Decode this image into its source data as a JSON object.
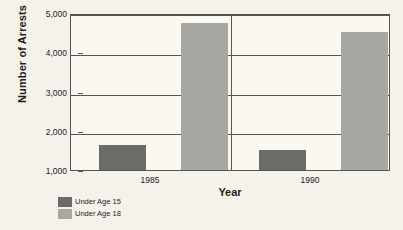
{
  "chart_data": {
    "type": "bar",
    "title": "",
    "xlabel": "Year",
    "ylabel": "Number of Arrests",
    "categories": [
      "1985",
      "1990"
    ],
    "series": [
      {
        "name": "Under Age 15",
        "color": "#6b6b68",
        "values": [
          1650,
          1520
        ]
      },
      {
        "name": "Under Age 18",
        "color": "#a8a8a3",
        "values": [
          4750,
          4520
        ]
      }
    ],
    "ylim": [
      1000,
      5000
    ],
    "yticks": [
      1000,
      2000,
      3000,
      4000,
      5000
    ],
    "ytick_labels": [
      "1,000",
      "2,000",
      "3,000",
      "4,000",
      "5,000"
    ],
    "grid": true,
    "legend_position": "bottom-left",
    "background_color": "#f4f2ea",
    "plot_background_color": "#faf8f1",
    "axis_color": "#55544e"
  },
  "legend": {
    "items": [
      {
        "label": "Under Age 15"
      },
      {
        "label": "Under Age 18"
      }
    ]
  }
}
